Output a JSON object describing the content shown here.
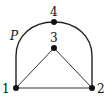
{
  "diagram": {
    "nodes": [
      {
        "id": "1",
        "label": "1",
        "x": 16,
        "y": 88
      },
      {
        "id": "2",
        "label": "2",
        "x": 92,
        "y": 88
      },
      {
        "id": "3",
        "label": "3",
        "x": 54,
        "y": 48
      },
      {
        "id": "4",
        "label": "4",
        "x": 54,
        "y": 22
      }
    ],
    "edges": [
      {
        "from": "1",
        "to": "2"
      },
      {
        "from": "1",
        "to": "3"
      },
      {
        "from": "3",
        "to": "2"
      }
    ],
    "path_label": "P",
    "path": [
      "1",
      "4",
      "2"
    ]
  }
}
